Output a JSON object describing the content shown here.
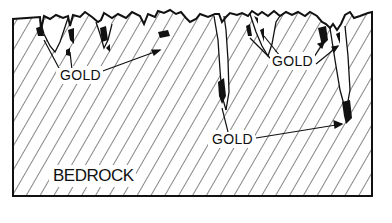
{
  "diagram": {
    "type": "geological cross-section",
    "labels": {
      "gold_1": "GOLD",
      "gold_2": "GOLD",
      "gold_3": "GOLD",
      "bedrock": "BEDROCK"
    },
    "colors": {
      "line": "#111111",
      "background": "#ffffff",
      "gold_deposit": "#111111"
    }
  }
}
